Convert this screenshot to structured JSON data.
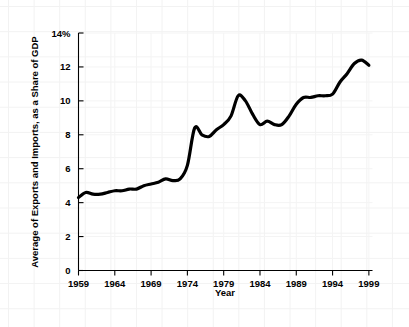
{
  "chart_data": {
    "type": "line",
    "title": "",
    "subtitle": "",
    "xlabel": "Year",
    "ylabel": "Average of Exports and Imports, as a Share of GDP",
    "xlim": [
      1959,
      1999.5
    ],
    "ylim": [
      0,
      14
    ],
    "xticks": [
      1959,
      1964,
      1969,
      1974,
      1979,
      1984,
      1989,
      1994,
      1999
    ],
    "xtick_labels": [
      "1959",
      "1964",
      "1969",
      "1974",
      "1979",
      "1984",
      "1989",
      "1994",
      "1999"
    ],
    "yticks": [
      0,
      2,
      4,
      6,
      8,
      10,
      12,
      14
    ],
    "ytick_labels": [
      "0",
      "2",
      "4",
      "6",
      "8",
      "10",
      "12",
      "14%"
    ],
    "grid": true,
    "legend": false,
    "legend_position": "none",
    "series": [
      {
        "name": "Average of Exports and Imports, as a Share of GDP",
        "color": "#000000",
        "x": [
          1959,
          1960,
          1961,
          1962,
          1963,
          1964,
          1965,
          1966,
          1967,
          1968,
          1969,
          1970,
          1971,
          1972,
          1973,
          1974,
          1975,
          1976,
          1977,
          1978,
          1979,
          1980,
          1981,
          1982,
          1983,
          1984,
          1985,
          1986,
          1987,
          1988,
          1989,
          1990,
          1991,
          1992,
          1993,
          1994,
          1995,
          1996,
          1997,
          1998,
          1999
        ],
        "values": [
          4.3,
          4.6,
          4.5,
          4.5,
          4.6,
          4.7,
          4.7,
          4.8,
          4.8,
          5.0,
          5.1,
          5.2,
          5.4,
          5.3,
          5.4,
          6.2,
          8.4,
          8.0,
          7.9,
          8.3,
          8.6,
          9.1,
          10.3,
          10.0,
          9.2,
          8.6,
          8.8,
          8.6,
          8.6,
          9.1,
          9.8,
          10.2,
          10.2,
          10.3,
          10.3,
          10.4,
          11.1,
          11.6,
          12.2,
          12.4,
          12.1
        ]
      }
    ]
  },
  "axes": {
    "y_axis_title": "Average of Exports and Imports, as a Share of GDP",
    "x_axis_title": "Year"
  }
}
